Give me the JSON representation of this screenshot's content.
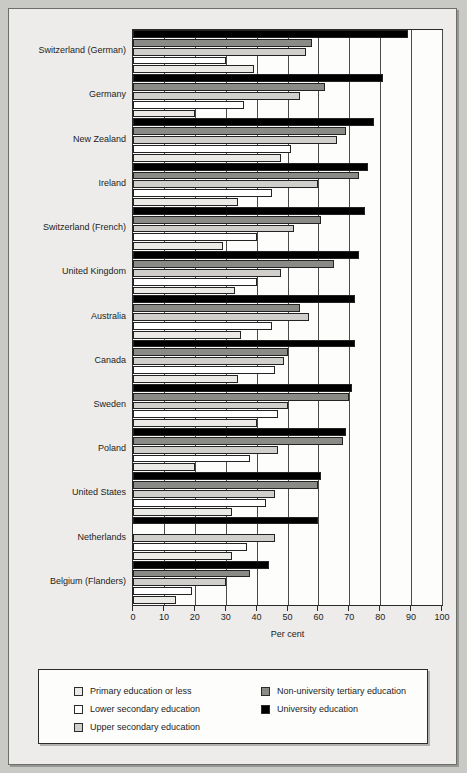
{
  "chart_data": {
    "type": "bar",
    "orientation": "horizontal",
    "title": "",
    "xlabel": "Per cent",
    "ylabel": "",
    "xlim": [
      0,
      100
    ],
    "xticks": [
      0,
      10,
      20,
      30,
      40,
      50,
      60,
      70,
      80,
      90,
      100
    ],
    "grid": true,
    "legend_position": "bottom",
    "categories": [
      "Switzerland (German)",
      "Germany",
      "New Zealand",
      "Ireland",
      "Switzerland (French)",
      "United Kingdom",
      "Australia",
      "Canada",
      "Sweden",
      "Poland",
      "United States",
      "Netherlands",
      "Belgium (Flanders)"
    ],
    "series": [
      {
        "name": "University education",
        "key": "university",
        "color": "#000000",
        "values": [
          89,
          81,
          78,
          76,
          75,
          73,
          72,
          72,
          71,
          69,
          61,
          60,
          44
        ]
      },
      {
        "name": "Non-university tertiary education",
        "key": "non_university_tertiary",
        "color": "#8a8a87",
        "values": [
          58,
          62,
          69,
          73,
          61,
          65,
          54,
          50,
          70,
          68,
          60,
          0,
          38
        ]
      },
      {
        "name": "Upper secondary education",
        "key": "upper_secondary",
        "color": "#d0cfcb",
        "values": [
          56,
          54,
          66,
          60,
          52,
          48,
          57,
          49,
          50,
          47,
          46,
          46,
          30
        ]
      },
      {
        "name": "Lower secondary education",
        "key": "lower_secondary",
        "color": "#ffffff",
        "values": [
          30,
          36,
          51,
          45,
          40,
          40,
          45,
          46,
          47,
          38,
          43,
          37,
          19
        ]
      },
      {
        "name": "Primary education or less",
        "key": "primary",
        "color": "#eceae6",
        "values": [
          39,
          20,
          48,
          34,
          29,
          33,
          35,
          34,
          40,
          20,
          32,
          32,
          14
        ]
      }
    ]
  },
  "legend": {
    "left_items": [
      {
        "label": "Primary education or less",
        "color": "#eceae6"
      },
      {
        "label": "Lower secondary education",
        "color": "#ffffff"
      },
      {
        "label": "Upper secondary education",
        "color": "#d0cfcb"
      }
    ],
    "right_items": [
      {
        "label": "Non-university tertiary education",
        "color": "#8a8a87"
      },
      {
        "label": "University education",
        "color": "#000000"
      }
    ]
  }
}
